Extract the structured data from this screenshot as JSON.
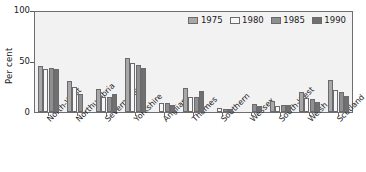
{
  "chart_data": {
    "type": "bar",
    "title": "",
    "xlabel": "",
    "ylabel": "Per cent",
    "ylim": [
      0,
      100
    ],
    "yticks": [
      0,
      50,
      100
    ],
    "ytick_labels": [
      "0",
      "50",
      "100"
    ],
    "grid": false,
    "legend_position": "top-right",
    "categories": [
      "North-West",
      "Northumbria",
      "Severn-Trent",
      "Yorkshire",
      "Anglian",
      "Thames",
      "Southern",
      "Wessex",
      "South-West",
      "Welsh",
      "Scotland"
    ],
    "series": [
      {
        "name": "1975",
        "color": "#a8a8a8",
        "values": [
          45,
          30,
          23,
          53,
          0,
          24,
          0,
          0,
          11,
          20,
          31
        ]
      },
      {
        "name": "1980",
        "color": "#f7f7f7",
        "values": [
          42,
          25,
          15,
          48,
          9,
          15,
          4,
          0,
          6,
          14,
          22
        ]
      },
      {
        "name": "1985",
        "color": "#8f8f8f",
        "values": [
          43,
          18,
          15,
          46,
          9,
          15,
          3,
          8,
          7,
          13,
          20
        ]
      },
      {
        "name": "1990",
        "color": "#707070",
        "values": [
          42,
          0,
          18,
          43,
          7,
          21,
          3,
          6,
          7,
          10,
          16
        ]
      }
    ]
  }
}
